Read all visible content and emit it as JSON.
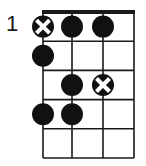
{
  "diagram": {
    "type": "fretboard-diagram",
    "start_fret_label": "1",
    "strings": 4,
    "frets_shown": 5,
    "colors": {
      "line": "#1a1a1a",
      "dot": "#111111",
      "cross": "#ffffff",
      "background": "#ffffff"
    },
    "markers": [
      {
        "string": 1,
        "fret": 1,
        "type": "root-x"
      },
      {
        "string": 2,
        "fret": 1,
        "type": "dot"
      },
      {
        "string": 3,
        "fret": 1,
        "type": "dot"
      },
      {
        "string": 1,
        "fret": 2,
        "type": "dot"
      },
      {
        "string": 2,
        "fret": 3,
        "type": "dot"
      },
      {
        "string": 3,
        "fret": 3,
        "type": "root-x"
      },
      {
        "string": 1,
        "fret": 4,
        "type": "dot"
      },
      {
        "string": 2,
        "fret": 4,
        "type": "dot"
      }
    ]
  }
}
